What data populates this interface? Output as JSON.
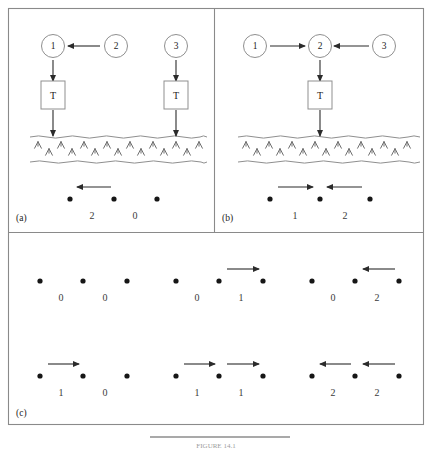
{
  "figure": {
    "caption": "FIGURE 14.1",
    "panels": [
      {
        "id": "a",
        "label": "(a)",
        "nodes": [
          {
            "name": "node-1",
            "text": "1",
            "cx": 53,
            "cy": 46
          },
          {
            "name": "node-2",
            "text": "2",
            "cx": 116,
            "cy": 46
          },
          {
            "name": "node-3",
            "text": "3",
            "cx": 176,
            "cy": 46
          }
        ],
        "boxes": [
          {
            "name": "transformer-box-left",
            "text": "T",
            "cx": 53,
            "cy": 95
          },
          {
            "name": "transformer-box-right",
            "text": "T",
            "cx": 176,
            "cy": 95
          }
        ],
        "flow_arrows": [
          {
            "name": "arrow-2-to-1",
            "direction": "left",
            "x1": 100,
            "x2": 68,
            "y": 46
          },
          {
            "name": "arrow-1-to-box",
            "direction": "down",
            "x": 53,
            "y1": 60,
            "y2": 81
          },
          {
            "name": "arrow-3-to-box",
            "direction": "down",
            "x": 176,
            "y1": 60,
            "y2": 81
          },
          {
            "name": "arrow-box-left-to-ground",
            "direction": "down",
            "x": 53,
            "y1": 110,
            "y2": 136
          },
          {
            "name": "arrow-box-right-to-ground",
            "direction": "down",
            "x": 176,
            "y1": 110,
            "y2": 136
          }
        ],
        "ground": {
          "name": "ground-band",
          "top_y": 137,
          "bottom_y": 162,
          "x1": 30,
          "x2": 207
        },
        "dots": [
          {
            "name": "bus-dot",
            "cx": 70,
            "cy": 199
          },
          {
            "name": "bus-dot",
            "cx": 114,
            "cy": 199
          },
          {
            "name": "bus-dot",
            "cx": 157,
            "cy": 199
          }
        ],
        "dot_arrows": [
          {
            "name": "dot-arrow-left",
            "direction": "left",
            "x1": 111,
            "x2": 77,
            "y": 187
          }
        ],
        "values": [
          {
            "name": "value-label",
            "text": "2",
            "x": 92,
            "y": 215
          },
          {
            "name": "value-label",
            "text": "0",
            "x": 135,
            "y": 215
          }
        ]
      },
      {
        "id": "b",
        "label": "(b)",
        "nodes": [
          {
            "name": "node-1",
            "text": "1",
            "cx": 255,
            "cy": 46
          },
          {
            "name": "node-2",
            "text": "2",
            "cx": 320,
            "cy": 46
          },
          {
            "name": "node-3",
            "text": "3",
            "cx": 384,
            "cy": 46
          }
        ],
        "boxes": [
          {
            "name": "transformer-box-center",
            "text": "T",
            "cx": 320,
            "cy": 95
          }
        ],
        "flow_arrows": [
          {
            "name": "arrow-1-to-2",
            "direction": "right",
            "x1": 270,
            "x2": 305,
            "y": 46
          },
          {
            "name": "arrow-3-to-2",
            "direction": "left",
            "x1": 369,
            "x2": 334,
            "y": 46
          },
          {
            "name": "arrow-2-to-box",
            "direction": "down",
            "x": 320,
            "y1": 60,
            "y2": 81
          },
          {
            "name": "arrow-box-to-ground",
            "direction": "down",
            "x": 320,
            "y1": 110,
            "y2": 136
          }
        ],
        "ground": {
          "name": "ground-band",
          "top_y": 137,
          "bottom_y": 162,
          "x1": 238,
          "x2": 420
        },
        "dots": [
          {
            "name": "bus-dot",
            "cx": 270,
            "cy": 199
          },
          {
            "name": "bus-dot",
            "cx": 320,
            "cy": 199
          },
          {
            "name": "bus-dot",
            "cx": 370,
            "cy": 199
          }
        ],
        "dot_arrows": [
          {
            "name": "dot-arrow-right",
            "direction": "right",
            "x1": 278,
            "x2": 313,
            "y": 187
          },
          {
            "name": "dot-arrow-left",
            "direction": "left",
            "x1": 362,
            "x2": 327,
            "y": 187
          }
        ],
        "values": [
          {
            "name": "value-label",
            "text": "1",
            "x": 295,
            "y": 215
          },
          {
            "name": "value-label",
            "text": "2",
            "x": 345,
            "y": 215
          }
        ]
      },
      {
        "id": "c",
        "label": "(c)",
        "rows": [
          {
            "name": "case-row-top",
            "groups": [
              {
                "name": "case-group",
                "dots": [
                  40,
                  83,
                  127
                ],
                "arrows": [],
                "values": [
                  {
                    "text": "0",
                    "x": 61
                  },
                  {
                    "text": "0",
                    "x": 105
                  }
                ]
              },
              {
                "name": "case-group",
                "dots": [
                  176,
                  219,
                  263
                ],
                "arrows": [
                  {
                    "name": "dot-arrow-right",
                    "direction": "right",
                    "x1": 227,
                    "x2": 259
                  }
                ],
                "values": [
                  {
                    "text": "0",
                    "x": 197
                  },
                  {
                    "text": "1",
                    "x": 241
                  }
                ]
              },
              {
                "name": "case-group",
                "dots": [
                  312,
                  355,
                  399
                ],
                "arrows": [
                  {
                    "name": "dot-arrow-left",
                    "direction": "left",
                    "x1": 395,
                    "x2": 363
                  }
                ],
                "values": [
                  {
                    "text": "0",
                    "x": 333
                  },
                  {
                    "text": "2",
                    "x": 377
                  }
                ]
              }
            ],
            "dot_y": 281,
            "arrow_y": 269,
            "value_y": 297
          },
          {
            "name": "case-row-bottom",
            "groups": [
              {
                "name": "case-group",
                "dots": [
                  40,
                  83,
                  127
                ],
                "arrows": [
                  {
                    "name": "dot-arrow-right",
                    "direction": "right",
                    "x1": 48,
                    "x2": 79
                  }
                ],
                "values": [
                  {
                    "text": "1",
                    "x": 61
                  },
                  {
                    "text": "0",
                    "x": 105
                  }
                ]
              },
              {
                "name": "case-group",
                "dots": [
                  176,
                  219,
                  263
                ],
                "arrows": [
                  {
                    "name": "dot-arrow-right",
                    "direction": "right",
                    "x1": 184,
                    "x2": 215
                  },
                  {
                    "name": "dot-arrow-right",
                    "direction": "right",
                    "x1": 227,
                    "x2": 259
                  }
                ],
                "values": [
                  {
                    "text": "1",
                    "x": 197
                  },
                  {
                    "text": "1",
                    "x": 241
                  }
                ]
              },
              {
                "name": "case-group",
                "dots": [
                  312,
                  355,
                  399
                ],
                "arrows": [
                  {
                    "name": "dot-arrow-left",
                    "direction": "left",
                    "x1": 351,
                    "x2": 320
                  },
                  {
                    "name": "dot-arrow-left",
                    "direction": "left",
                    "x1": 395,
                    "x2": 363
                  }
                ],
                "values": [
                  {
                    "text": "2",
                    "x": 333
                  },
                  {
                    "text": "2",
                    "x": 377
                  }
                ]
              }
            ],
            "dot_y": 376,
            "arrow_y": 364,
            "value_y": 392
          }
        ]
      }
    ]
  }
}
